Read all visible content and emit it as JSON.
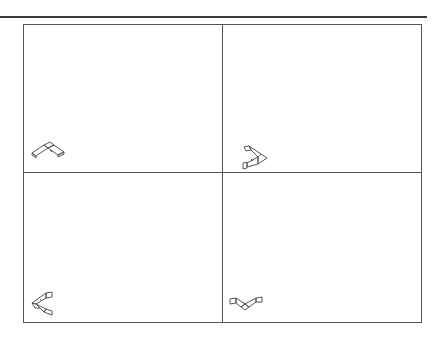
{
  "layout": {
    "viewports": [
      {
        "id": "top-left",
        "position": "upper-left",
        "triad_orientation": "isometric-north"
      },
      {
        "id": "top-right",
        "position": "upper-right",
        "triad_orientation": "rotated-right"
      },
      {
        "id": "bottom-left",
        "position": "lower-left",
        "triad_orientation": "rotated-left"
      },
      {
        "id": "bottom-right",
        "position": "lower-right",
        "triad_orientation": "isometric-south"
      }
    ]
  },
  "icons": {
    "triad": "view-orientation-triad-icon"
  },
  "colors": {
    "frame": "#555555",
    "rule": "#3a3a3a",
    "icon_stroke": "#555555",
    "background": "#ffffff"
  }
}
